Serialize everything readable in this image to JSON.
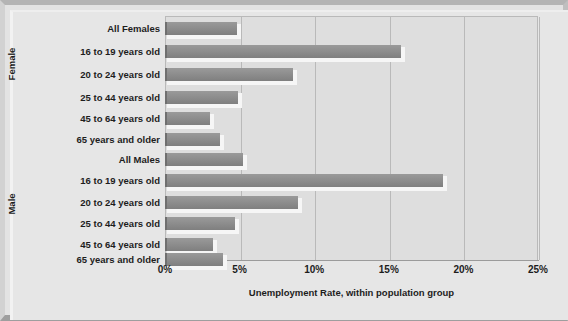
{
  "chart_data": {
    "type": "bar",
    "orientation": "horizontal",
    "title": "",
    "xlabel": "Unemployment Rate, within population group",
    "ylabel": "",
    "xlim": [
      0,
      25
    ],
    "xticks": [
      0,
      5,
      10,
      15,
      20,
      25
    ],
    "xtick_labels": [
      "0%",
      "5%",
      "10%",
      "15%",
      "20%",
      "25%"
    ],
    "grid": true,
    "legend": false,
    "groups": [
      {
        "name": "Female",
        "categories": [
          "All Females",
          "16 to 19 years old",
          "20 to 24 years old",
          "25 to 44 years old",
          "45 to 64 years old",
          "65 years and older"
        ],
        "values": [
          4.8,
          15.8,
          8.6,
          4.9,
          3.0,
          3.7
        ]
      },
      {
        "name": "Male",
        "categories": [
          "All Males",
          "16 to 19 years old",
          "20 to 24 years old",
          "25 to 44 years old",
          "45 to 64 years old",
          "65 years and older"
        ],
        "values": [
          5.2,
          18.6,
          8.9,
          4.7,
          3.2,
          3.9
        ]
      }
    ],
    "colors": {
      "bar": "#8e8e8e",
      "bar_edge": "#6f6f6f",
      "plot_background": "#dedede",
      "figure_background": "#e6e6e6",
      "gridline": "#b9b9b9",
      "text": "#1d1d1d"
    }
  }
}
